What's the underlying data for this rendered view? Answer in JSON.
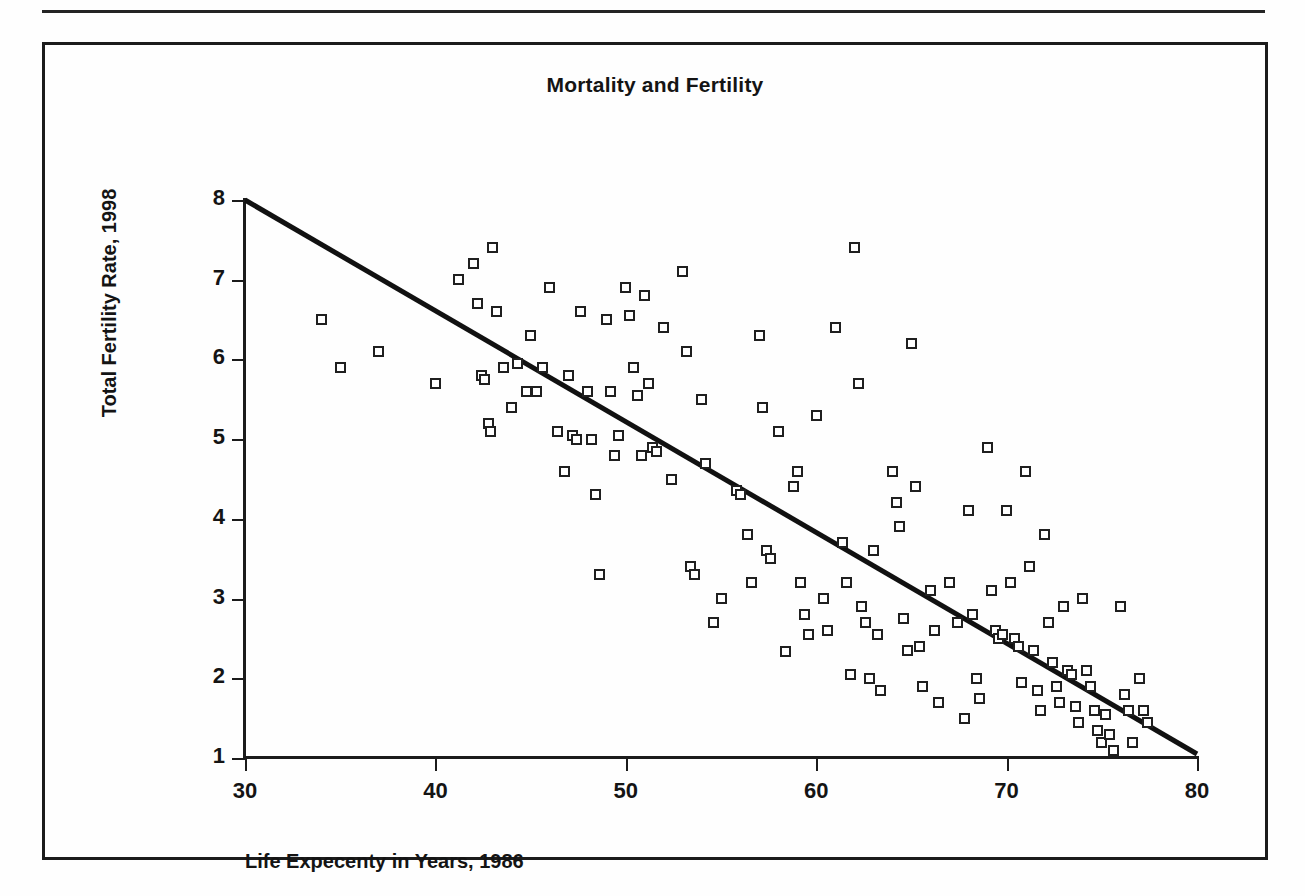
{
  "figure": {
    "top_rule": "horizontal-rule",
    "frame": "figure-border"
  },
  "chart_data": {
    "type": "scatter",
    "title": "Mortality and Fertility",
    "xlabel": "Life Expecenty in Years, 1986",
    "ylabel": "Total Fertility Rate, 1998",
    "xlim": [
      30,
      80
    ],
    "ylim": [
      1,
      8
    ],
    "xticks": [
      30,
      40,
      50,
      60,
      70,
      80
    ],
    "yticks": [
      1,
      2,
      3,
      4,
      5,
      6,
      7,
      8
    ],
    "grid": false,
    "legend": null,
    "marker": "open-square",
    "marker_color": "#1f1f1f",
    "trendline": {
      "label": "linear-fit",
      "color": "#111111",
      "width_px": 5,
      "x0": 30,
      "y0": 8.0,
      "x1": 80,
      "y1": 1.05
    },
    "points": [
      [
        34.0,
        6.5
      ],
      [
        35.0,
        5.9
      ],
      [
        37.0,
        6.1
      ],
      [
        40.0,
        5.7
      ],
      [
        41.2,
        7.0
      ],
      [
        42.0,
        7.2
      ],
      [
        42.2,
        6.7
      ],
      [
        42.4,
        5.8
      ],
      [
        42.6,
        5.75
      ],
      [
        42.8,
        5.2
      ],
      [
        42.9,
        5.1
      ],
      [
        43.0,
        7.4
      ],
      [
        43.2,
        6.6
      ],
      [
        43.6,
        5.9
      ],
      [
        44.0,
        5.4
      ],
      [
        44.3,
        5.95
      ],
      [
        44.8,
        5.6
      ],
      [
        45.0,
        6.3
      ],
      [
        45.3,
        5.6
      ],
      [
        45.6,
        5.9
      ],
      [
        46.0,
        6.9
      ],
      [
        46.4,
        5.1
      ],
      [
        46.8,
        4.6
      ],
      [
        47.0,
        5.8
      ],
      [
        47.2,
        5.05
      ],
      [
        47.4,
        5.0
      ],
      [
        47.6,
        6.6
      ],
      [
        48.0,
        5.6
      ],
      [
        48.2,
        5.0
      ],
      [
        48.4,
        4.3
      ],
      [
        48.6,
        3.3
      ],
      [
        49.0,
        6.5
      ],
      [
        49.2,
        5.6
      ],
      [
        49.4,
        4.8
      ],
      [
        49.6,
        5.05
      ],
      [
        50.0,
        6.9
      ],
      [
        50.2,
        6.55
      ],
      [
        50.4,
        5.9
      ],
      [
        50.6,
        5.55
      ],
      [
        50.8,
        4.8
      ],
      [
        51.0,
        6.8
      ],
      [
        51.2,
        5.7
      ],
      [
        51.4,
        4.9
      ],
      [
        51.6,
        4.85
      ],
      [
        52.0,
        6.4
      ],
      [
        52.4,
        4.5
      ],
      [
        53.0,
        7.1
      ],
      [
        53.2,
        6.1
      ],
      [
        53.4,
        3.4
      ],
      [
        53.6,
        3.3
      ],
      [
        54.0,
        5.5
      ],
      [
        54.2,
        4.7
      ],
      [
        54.6,
        2.7
      ],
      [
        55.0,
        3.0
      ],
      [
        55.8,
        4.35
      ],
      [
        56.0,
        4.3
      ],
      [
        56.4,
        3.8
      ],
      [
        56.6,
        3.2
      ],
      [
        57.0,
        6.3
      ],
      [
        57.2,
        5.4
      ],
      [
        57.4,
        3.6
      ],
      [
        57.6,
        3.5
      ],
      [
        58.0,
        5.1
      ],
      [
        58.4,
        2.33
      ],
      [
        58.8,
        4.4
      ],
      [
        59.0,
        4.6
      ],
      [
        59.2,
        3.2
      ],
      [
        59.4,
        2.8
      ],
      [
        59.6,
        2.55
      ],
      [
        60.0,
        5.3
      ],
      [
        60.4,
        3.0
      ],
      [
        60.6,
        2.6
      ],
      [
        61.0,
        6.4
      ],
      [
        61.4,
        3.7
      ],
      [
        61.6,
        3.2
      ],
      [
        61.8,
        2.05
      ],
      [
        62.0,
        7.4
      ],
      [
        62.2,
        5.7
      ],
      [
        62.4,
        2.9
      ],
      [
        62.6,
        2.7
      ],
      [
        62.8,
        2.0
      ],
      [
        63.0,
        3.6
      ],
      [
        63.2,
        2.55
      ],
      [
        63.4,
        1.85
      ],
      [
        64.0,
        4.6
      ],
      [
        64.2,
        4.2
      ],
      [
        64.4,
        3.9
      ],
      [
        64.6,
        2.75
      ],
      [
        64.8,
        2.35
      ],
      [
        65.0,
        6.2
      ],
      [
        65.2,
        4.4
      ],
      [
        65.4,
        2.4
      ],
      [
        65.6,
        1.9
      ],
      [
        66.0,
        3.1
      ],
      [
        66.2,
        2.6
      ],
      [
        66.4,
        1.7
      ],
      [
        67.0,
        3.2
      ],
      [
        67.4,
        2.7
      ],
      [
        67.8,
        1.5
      ],
      [
        68.0,
        4.1
      ],
      [
        68.2,
        2.8
      ],
      [
        68.4,
        2.0
      ],
      [
        68.6,
        1.75
      ],
      [
        69.0,
        4.9
      ],
      [
        69.2,
        3.1
      ],
      [
        69.4,
        2.6
      ],
      [
        69.6,
        2.5
      ],
      [
        69.8,
        2.55
      ],
      [
        70.0,
        4.1
      ],
      [
        70.2,
        3.2
      ],
      [
        70.4,
        2.5
      ],
      [
        70.6,
        2.4
      ],
      [
        70.8,
        1.95
      ],
      [
        71.0,
        4.6
      ],
      [
        71.2,
        3.4
      ],
      [
        71.4,
        2.35
      ],
      [
        71.6,
        1.85
      ],
      [
        71.8,
        1.6
      ],
      [
        72.0,
        3.8
      ],
      [
        72.2,
        2.7
      ],
      [
        72.4,
        2.2
      ],
      [
        72.6,
        1.9
      ],
      [
        72.8,
        1.7
      ],
      [
        73.0,
        2.9
      ],
      [
        73.2,
        2.1
      ],
      [
        73.4,
        2.05
      ],
      [
        73.6,
        1.65
      ],
      [
        73.8,
        1.45
      ],
      [
        74.0,
        3.0
      ],
      [
        74.2,
        2.1
      ],
      [
        74.4,
        1.9
      ],
      [
        74.6,
        1.6
      ],
      [
        74.8,
        1.35
      ],
      [
        75.0,
        1.2
      ],
      [
        75.2,
        1.55
      ],
      [
        75.4,
        1.3
      ],
      [
        75.6,
        1.1
      ],
      [
        76.0,
        2.9
      ],
      [
        76.2,
        1.8
      ],
      [
        76.4,
        1.6
      ],
      [
        76.6,
        1.2
      ],
      [
        77.0,
        2.0
      ],
      [
        77.2,
        1.6
      ],
      [
        77.4,
        1.45
      ]
    ]
  }
}
